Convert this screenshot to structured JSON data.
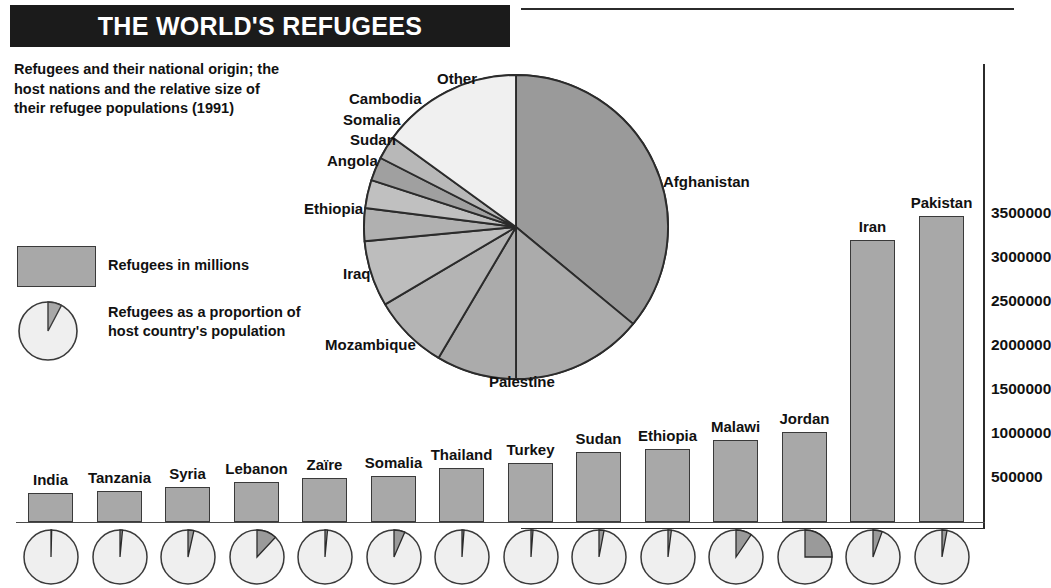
{
  "header": {
    "title": "THE WORLD'S REFUGEES",
    "subtitle": "Refugees and their national origin; the host nations and the relative size of their refugee populations (1991)"
  },
  "legend": {
    "bar_label": "Refugees in millions",
    "pie_label": "Refugees as a proportion of host country's population",
    "bar_color": "#a8a8a8",
    "pie_fill": "#efefef",
    "pie_slice": "#a8a8a8",
    "outline": "#3a3a3a"
  },
  "axis": {
    "ticks": [
      "3500000",
      "3000000",
      "2500000",
      "2000000",
      "1500000",
      "1000000",
      "500000"
    ],
    "max": 3750000
  },
  "chart_data": [
    {
      "type": "pie",
      "title": "Refugees by country of origin (1991)",
      "labels": [
        "Afghanistan",
        "Palestine",
        "Mozambique",
        "Iraq",
        "Ethiopia",
        "Angola",
        "Sudan",
        "Somalia",
        "Cambodia",
        "Other"
      ],
      "values": [
        36.0,
        14.0,
        8.5,
        8.0,
        7.0,
        3.5,
        3.0,
        2.5,
        2.5,
        15.0
      ],
      "units": "percent of world refugees",
      "legend": "none",
      "label_placement": "callout"
    },
    {
      "type": "bar",
      "title": "Refugee populations by host nation (1991)",
      "categories": [
        "India",
        "Tanzania",
        "Syria",
        "Lebanon",
        "Zaïre",
        "Somalia",
        "Thailand",
        "Turkey",
        "Sudan",
        "Ethiopia",
        "Malawi",
        "Jordan",
        "Iran",
        "Pakistan"
      ],
      "values": [
        330000,
        355000,
        400000,
        450000,
        500000,
        525000,
        610000,
        670000,
        800000,
        830000,
        930000,
        1020000,
        3200000,
        3480000
      ],
      "ylabel": "Refugees",
      "xlabel": "",
      "ylim": [
        0,
        3750000
      ],
      "grid": false,
      "series": [
        {
          "name": "Refugees as a proportion of host country's population (%)",
          "type": "pie-glyph",
          "values": [
            0.4,
            1.5,
            3.5,
            12.0,
            1.5,
            6.5,
            1.2,
            1.2,
            3.0,
            2.0,
            9.5,
            25.0,
            5.5,
            3.0
          ]
        }
      ]
    }
  ]
}
